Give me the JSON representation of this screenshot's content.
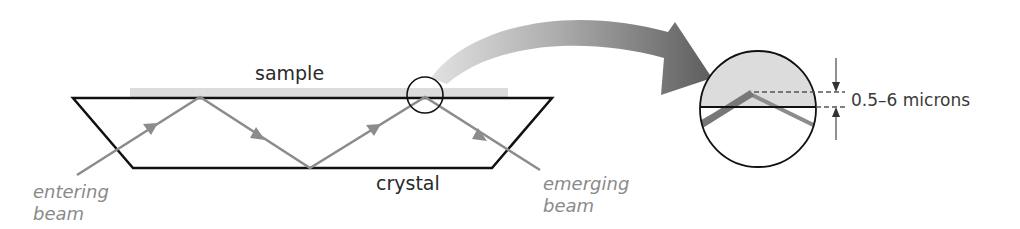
{
  "diagram": {
    "labels": {
      "sample": "sample",
      "crystal": "crystal",
      "entering_line1": "entering",
      "entering_line2": "beam",
      "emerging_line1": "emerging",
      "emerging_line2": "beam",
      "penetration_depth": "0.5–6 microns"
    },
    "colors": {
      "outline": "#111111",
      "beam": "#8c8c8c",
      "sample_fill": "#dcdcdc",
      "arrow_light": "#d8d8d8",
      "arrow_dark": "#5a5a5a",
      "label_grey": "#8a8a8a"
    },
    "elements": {
      "crystal": "trapezoid crystal with internal reflections",
      "sample": "sample layer on top surface of crystal",
      "beam_reflections": 4,
      "detail_circle": "magnified view of reflection point",
      "zoom_arrow": "curved arrow from detail circle to magnified view"
    }
  }
}
